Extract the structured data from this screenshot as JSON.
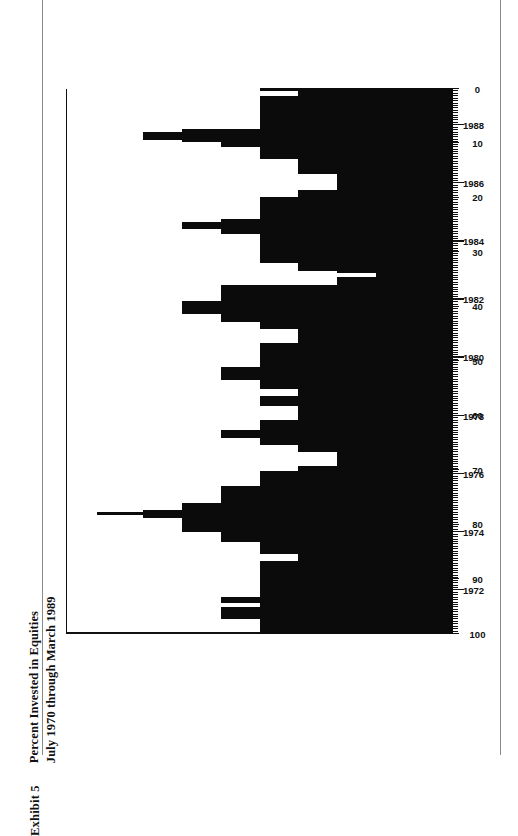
{
  "page": {
    "exhibit_label": "Exhibit 5",
    "title_line_1": "Percent Invested in Equities",
    "title_line_2": "July 1970 through March 1989",
    "ink_color": "#0b0b0b",
    "paper_color": "#ffffff",
    "frame_color": "#8a8a8a"
  },
  "chart_data": {
    "type": "bar",
    "orientation": "horizontal",
    "title": "Percent Invested in Equities",
    "subtitle": "July 1970 through March 1989",
    "xlabel": "",
    "ylabel": "",
    "value_axis_label": "Percent Invested in Equities",
    "value_ticks": [
      100,
      90,
      80,
      70,
      60,
      50,
      40,
      30,
      20,
      10,
      0
    ],
    "value_axis_range": [
      0,
      100
    ],
    "value_axis_direction": "descending-left-to-right",
    "time_axis_label": "",
    "time_ticks": [
      1970,
      1972,
      1974,
      1976,
      1978,
      1980,
      1982,
      1984,
      1986,
      1988
    ],
    "time_range": [
      "1970-07",
      "1989-03"
    ],
    "time_tick_interval_minor": "monthly",
    "grid": false,
    "legend": null,
    "series_name": "Percent invested in equities",
    "categories": [
      "1970-07",
      "1970-08",
      "1970-09",
      "1970-10",
      "1970-11",
      "1970-12",
      "1971-01",
      "1971-02",
      "1971-03",
      "1971-04",
      "1971-05",
      "1971-06",
      "1971-07",
      "1971-08",
      "1971-09",
      "1971-10",
      "1971-11",
      "1971-12",
      "1972-01",
      "1972-02",
      "1972-03",
      "1972-04",
      "1972-05",
      "1972-06",
      "1972-07",
      "1972-08",
      "1972-09",
      "1972-10",
      "1972-11",
      "1972-12",
      "1973-01",
      "1973-02",
      "1973-03",
      "1973-04",
      "1973-05",
      "1973-06",
      "1973-07",
      "1973-08",
      "1973-09",
      "1973-10",
      "1973-11",
      "1973-12",
      "1974-01",
      "1974-02",
      "1974-03",
      "1974-04",
      "1974-05",
      "1974-06",
      "1974-07",
      "1974-08",
      "1974-09",
      "1974-10",
      "1974-11",
      "1974-12",
      "1975-01",
      "1975-02",
      "1975-03",
      "1975-04",
      "1975-05",
      "1975-06",
      "1975-07",
      "1975-08",
      "1975-09",
      "1975-10",
      "1975-11",
      "1975-12",
      "1976-01",
      "1976-02",
      "1976-03",
      "1976-04",
      "1976-05",
      "1976-06",
      "1976-07",
      "1976-08",
      "1976-09",
      "1976-10",
      "1976-11",
      "1976-12",
      "1977-01",
      "1977-02",
      "1977-03",
      "1977-04",
      "1977-05",
      "1977-06",
      "1977-07",
      "1977-08",
      "1977-09",
      "1977-10",
      "1977-11",
      "1977-12",
      "1978-01",
      "1978-02",
      "1978-03",
      "1978-04",
      "1978-05",
      "1978-06",
      "1978-07",
      "1978-08",
      "1978-09",
      "1978-10",
      "1978-11",
      "1978-12",
      "1979-01",
      "1979-02",
      "1979-03",
      "1979-04",
      "1979-05",
      "1979-06",
      "1979-07",
      "1979-08",
      "1979-09",
      "1979-10",
      "1979-11",
      "1979-12",
      "1980-01",
      "1980-02",
      "1980-03",
      "1980-04",
      "1980-05",
      "1980-06",
      "1980-07",
      "1980-08",
      "1980-09",
      "1980-10",
      "1980-11",
      "1980-12",
      "1981-01",
      "1981-02",
      "1981-03",
      "1981-04",
      "1981-05",
      "1981-06",
      "1981-07",
      "1981-08",
      "1981-09",
      "1981-10",
      "1981-11",
      "1981-12",
      "1982-01",
      "1982-02",
      "1982-03",
      "1982-04",
      "1982-05",
      "1982-06",
      "1982-07",
      "1982-08",
      "1982-09",
      "1982-10",
      "1982-11",
      "1982-12",
      "1983-01",
      "1983-02",
      "1983-03",
      "1983-04",
      "1983-05",
      "1983-06",
      "1983-07",
      "1983-08",
      "1983-09",
      "1983-10",
      "1983-11",
      "1983-12",
      "1984-01",
      "1984-02",
      "1984-03",
      "1984-04",
      "1984-05",
      "1984-06",
      "1984-07",
      "1984-08",
      "1984-09",
      "1984-10",
      "1984-11",
      "1984-12",
      "1985-01",
      "1985-02",
      "1985-03",
      "1985-04",
      "1985-05",
      "1985-06",
      "1985-07",
      "1985-08",
      "1985-09",
      "1985-10",
      "1985-11",
      "1985-12",
      "1986-01",
      "1986-02",
      "1986-03",
      "1986-04",
      "1986-05",
      "1986-06",
      "1986-07",
      "1986-08",
      "1986-09",
      "1986-10",
      "1986-11",
      "1986-12",
      "1987-01",
      "1987-02",
      "1987-03",
      "1987-04",
      "1987-05",
      "1987-06",
      "1987-07",
      "1987-08",
      "1987-09",
      "1987-10",
      "1987-11",
      "1987-12",
      "1988-01",
      "1988-02",
      "1988-03",
      "1988-04",
      "1988-05",
      "1988-06",
      "1988-07",
      "1988-08",
      "1988-09",
      "1988-10",
      "1988-11",
      "1988-12",
      "1989-01",
      "1989-02",
      "1989-03"
    ],
    "values": [
      50,
      50,
      50,
      50,
      50,
      50,
      60,
      60,
      60,
      60,
      60,
      50,
      50,
      60,
      60,
      50,
      50,
      50,
      50,
      50,
      50,
      50,
      50,
      50,
      50,
      50,
      50,
      50,
      50,
      50,
      40,
      40,
      40,
      50,
      50,
      50,
      50,
      50,
      60,
      60,
      60,
      60,
      70,
      70,
      70,
      70,
      70,
      70,
      80,
      92,
      80,
      70,
      70,
      70,
      60,
      60,
      60,
      60,
      60,
      60,
      60,
      50,
      50,
      50,
      50,
      50,
      50,
      40,
      40,
      30,
      30,
      30,
      30,
      30,
      30,
      40,
      40,
      40,
      50,
      50,
      50,
      60,
      60,
      60,
      50,
      50,
      50,
      50,
      40,
      40,
      40,
      40,
      40,
      40,
      50,
      50,
      50,
      50,
      40,
      40,
      40,
      50,
      50,
      50,
      50,
      60,
      60,
      60,
      60,
      60,
      50,
      50,
      50,
      50,
      50,
      50,
      50,
      50,
      50,
      50,
      40,
      40,
      40,
      40,
      40,
      40,
      50,
      50,
      50,
      60,
      60,
      60,
      70,
      70,
      70,
      70,
      70,
      60,
      60,
      60,
      60,
      60,
      60,
      60,
      30,
      30,
      30,
      20,
      20,
      30,
      40,
      40,
      40,
      50,
      50,
      50,
      50,
      50,
      50,
      50,
      50,
      50,
      50,
      50,
      50,
      60,
      60,
      70,
      70,
      70,
      60,
      50,
      50,
      50,
      50,
      50,
      50,
      50,
      50,
      50,
      40,
      40,
      40,
      30,
      30,
      30,
      30,
      30,
      30,
      30,
      40,
      40,
      40,
      40,
      40,
      40,
      50,
      50,
      50,
      50,
      50,
      60,
      60,
      70,
      80,
      80,
      80,
      70,
      50,
      50,
      50,
      50,
      50,
      50,
      50,
      50,
      50,
      50,
      50,
      50,
      50,
      50,
      40,
      40,
      50
    ]
  }
}
